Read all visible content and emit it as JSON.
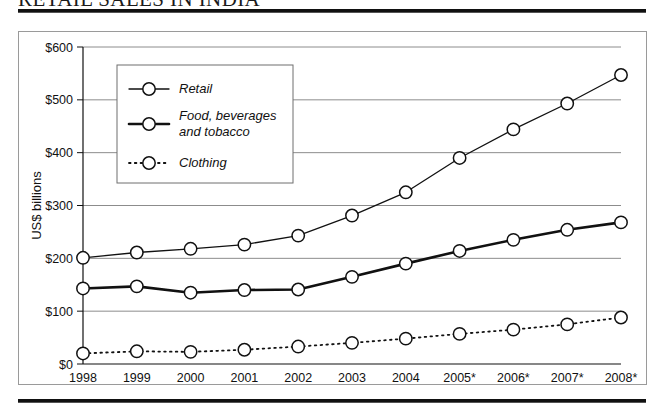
{
  "figure": {
    "title": "RETAIL SALES IN INDIA"
  },
  "chart_data": {
    "type": "line",
    "title": "RETAIL SALES IN INDIA",
    "xlabel": "",
    "ylabel": "US$ billions",
    "categories": [
      "1998",
      "1999",
      "2000",
      "2001",
      "2002",
      "2003",
      "2004",
      "2005*",
      "2006*",
      "2007*",
      "2008*"
    ],
    "ylim": [
      0,
      600
    ],
    "yticks": [
      0,
      100,
      200,
      300,
      400,
      500,
      600
    ],
    "ytick_labels": [
      "$0",
      "$100",
      "$200",
      "$300",
      "$400",
      "$500",
      "$600"
    ],
    "grid": "horizontal",
    "legend_position": "upper-left-inside",
    "note": "Asterisk (*) on 2005-2008 indicates forecast values",
    "series": [
      {
        "name": "Retail",
        "style": "solid-thin",
        "marker": "open-circle",
        "values": [
          201,
          211,
          218,
          226,
          243,
          281,
          325,
          390,
          444,
          493,
          547
        ]
      },
      {
        "name": "Food, beverages and tobacco",
        "style": "solid-thick",
        "marker": "open-circle",
        "values": [
          143,
          147,
          135,
          140,
          141,
          165,
          190,
          214,
          235,
          254,
          268
        ]
      },
      {
        "name": "Clothing",
        "style": "dotted",
        "marker": "open-circle",
        "values": [
          20,
          24,
          23,
          27,
          33,
          40,
          48,
          57,
          65,
          75,
          88
        ]
      }
    ]
  },
  "legend": {
    "items": [
      {
        "label": "Retail"
      },
      {
        "label": "Food, beverages"
      },
      {
        "label": "and tobacco"
      },
      {
        "label": "Clothing"
      }
    ]
  },
  "colors": {
    "line": "#111111",
    "grid": "#8c8c8c",
    "frame": "#9a9a9a",
    "marker_fill": "#ffffff",
    "text": "#111111"
  }
}
